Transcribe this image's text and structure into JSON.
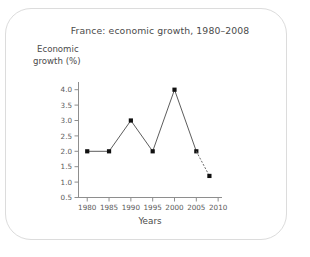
{
  "figure": {
    "title": "France: economic growth, 1980–2008",
    "x_axis_title": "Years",
    "y_axis_title_line1": "Economic",
    "y_axis_title_line2": "growth (%)",
    "border_color": "#dcdcdc",
    "text_color": "#4b4b4b",
    "axis_color": "#8e8e8e",
    "line_color": "#4a4a4a",
    "marker_color": "#111111"
  },
  "chart_data": {
    "type": "line",
    "title": "France: economic growth, 1980–2008",
    "xlabel": "Years",
    "ylabel": "Economic growth (%)",
    "xlim": [
      1978,
      2011
    ],
    "ylim": [
      0.5,
      4.25
    ],
    "grid": false,
    "legend": "none",
    "x_ticks": [
      1980,
      1985,
      1990,
      1995,
      2000,
      2005,
      2010
    ],
    "x_tick_labels": [
      "1980",
      "1985",
      "1990",
      "1995",
      "2000",
      "2005",
      "2010"
    ],
    "y_ticks": [
      0.5,
      1.0,
      1.5,
      2.0,
      2.5,
      3.0,
      3.5,
      4.0
    ],
    "y_tick_labels": [
      "0.5",
      "1.0",
      "1.5",
      "2.0",
      "2.5",
      "3.0",
      "3.5",
      "4.0"
    ],
    "series": [
      {
        "name": "Economic growth (observed)",
        "style": "solid",
        "markers": "square",
        "x": [
          1980,
          1985,
          1990,
          1995,
          2000,
          2005
        ],
        "values": [
          2.0,
          2.0,
          3.0,
          2.0,
          4.0,
          2.0
        ]
      },
      {
        "name": "Economic growth (projected)",
        "style": "dotted",
        "markers": "square",
        "x": [
          2005,
          2008
        ],
        "values": [
          2.0,
          1.2
        ]
      }
    ]
  }
}
